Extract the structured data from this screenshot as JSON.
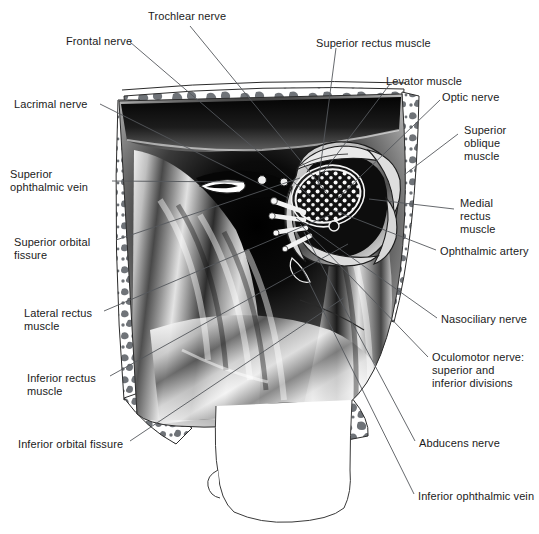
{
  "figure": {
    "background": "#ffffff",
    "ink": "#1b1b1b",
    "bone_fill": "#6f7378",
    "leader_color": "#55585c",
    "width": 539,
    "height": 534
  },
  "labels": [
    {
      "id": "trochlear-nerve",
      "text": "Trochlear nerve",
      "x": 148,
      "y": 10,
      "anchor": "start"
    },
    {
      "id": "frontal-nerve",
      "text": "Frontal nerve",
      "x": 66,
      "y": 35,
      "anchor": "start"
    },
    {
      "id": "lacrimal-nerve",
      "text": "Lacrimal nerve",
      "x": 14,
      "y": 98,
      "anchor": "start"
    },
    {
      "id": "superior-ophthalmic-vein",
      "text": "Superior\nophthalmic vein",
      "x": 10,
      "y": 168,
      "anchor": "start"
    },
    {
      "id": "superior-orbital-fissure",
      "text": "Superior orbital\nfissure",
      "x": 14,
      "y": 236,
      "anchor": "start"
    },
    {
      "id": "lateral-rectus-muscle",
      "text": "Lateral rectus\nmuscle",
      "x": 24,
      "y": 307,
      "anchor": "start"
    },
    {
      "id": "inferior-rectus-muscle",
      "text": "Inferior rectus\nmuscle",
      "x": 27,
      "y": 372,
      "anchor": "start"
    },
    {
      "id": "inferior-orbital-fissure",
      "text": "Inferior orbital fissure",
      "x": 18,
      "y": 438,
      "anchor": "start"
    },
    {
      "id": "superior-rectus-muscle",
      "text": "Superior rectus muscle",
      "x": 316,
      "y": 37,
      "anchor": "start"
    },
    {
      "id": "levator-muscle",
      "text": "Levator muscle",
      "x": 386,
      "y": 75,
      "anchor": "start"
    },
    {
      "id": "optic-nerve",
      "text": "Optic nerve",
      "x": 442,
      "y": 91,
      "anchor": "start"
    },
    {
      "id": "superior-oblique-muscle",
      "text": "Superior\noblique\nmuscle",
      "x": 464,
      "y": 124,
      "anchor": "start"
    },
    {
      "id": "medial-rectus-muscle",
      "text": "Medial\nrectus\nmuscle",
      "x": 460,
      "y": 197,
      "anchor": "start"
    },
    {
      "id": "ophthalmic-artery",
      "text": "Ophthalmic artery",
      "x": 440,
      "y": 245,
      "anchor": "start"
    },
    {
      "id": "nasociliary-nerve",
      "text": "Nasociliary nerve",
      "x": 441,
      "y": 313,
      "anchor": "start"
    },
    {
      "id": "oculomotor-nerve",
      "text": "Oculomotor nerve:\nsuperior and\ninferior divisions",
      "x": 432,
      "y": 351,
      "anchor": "start"
    },
    {
      "id": "abducens-nerve",
      "text": "Abducens nerve",
      "x": 419,
      "y": 437,
      "anchor": "start"
    },
    {
      "id": "inferior-ophthalmic-vein",
      "text": "Inferior ophthalmic vein",
      "x": 418,
      "y": 490,
      "anchor": "start"
    }
  ],
  "leaders": [
    {
      "id": "leader-trochlear-nerve",
      "path": "M 190 26 L 327 193"
    },
    {
      "id": "leader-frontal-nerve",
      "path": "M 130 42 L 310 196"
    },
    {
      "id": "leader-lacrimal-nerve",
      "path": "M 100 104 L 288 198"
    },
    {
      "id": "leader-superior-ophthalmic-vein",
      "path": "M 112 181 L 243 182"
    },
    {
      "id": "leader-superior-orbital-fissure",
      "path": "M 116 240 L 300 178"
    },
    {
      "id": "leader-lateral-rectus-muscle",
      "path": "M 104 311 L 330 215"
    },
    {
      "id": "leader-inferior-rectus-muscle",
      "path": "M 110 376 L 348 244"
    },
    {
      "id": "leader-inferior-orbital-fissure",
      "path": "M 130 441 L 345 297"
    },
    {
      "id": "leader-superior-rectus-muscle",
      "path": "M 336 48 L 318 185"
    },
    {
      "id": "leader-levator-muscle",
      "path": "M 390 84 L 322 174"
    },
    {
      "id": "leader-optic-nerve",
      "path": "M 440 100 L 336 200"
    },
    {
      "id": "leader-superior-oblique-muscle",
      "path": "M 458 134 L 404 175"
    },
    {
      "id": "leader-medial-rectus-muscle",
      "path": "M 454 209 L 369 199"
    },
    {
      "id": "leader-ophthalmic-artery",
      "path": "M 436 250 L 333 210"
    },
    {
      "id": "leader-nasociliary-nerve",
      "path": "M 437 318 L 296 218"
    },
    {
      "id": "leader-oculomotor-nerve",
      "path": "M 428 357 L 300 224"
    },
    {
      "id": "leader-abducens-nerve",
      "path": "M 415 441 L 304 232"
    },
    {
      "id": "leader-inferior-ophthalmic-vein",
      "path": "M 414 494 L 302 268"
    }
  ]
}
